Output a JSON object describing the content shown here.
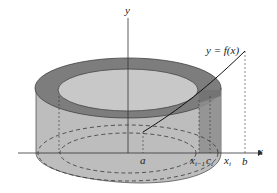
{
  "figure": {
    "colors": {
      "outer_wall": "#b9b9b9",
      "top_ring": "#7a7a7a",
      "inner_top": "#c6c6c6",
      "shell_strip": "#8f8f8f",
      "axis": "#333333"
    },
    "axes": {
      "x_label": "x",
      "y_label": "y"
    },
    "curve_label": "y = f(x)",
    "tick_labels": {
      "a": "a",
      "x_prev_base": "x",
      "x_prev_sub": "i−1",
      "c_base": "c",
      "c_sub": "i",
      "x_i_base": "x",
      "x_i_sub": "i",
      "b": "b"
    }
  }
}
